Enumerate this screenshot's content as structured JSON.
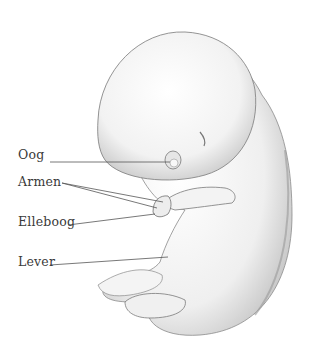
{
  "illustration": {
    "subject": "embryo-anatomy-drawing",
    "labels": [
      {
        "id": "oog",
        "text": "Oog",
        "x": 18,
        "y": 147
      },
      {
        "id": "armen",
        "text": "Armen",
        "x": 18,
        "y": 174
      },
      {
        "id": "elleboog",
        "text": "Elleboog",
        "x": 18,
        "y": 214
      },
      {
        "id": "lever",
        "text": "Lever",
        "x": 18,
        "y": 254
      }
    ],
    "colors": {
      "skin": "#f4f4f4",
      "shade": "#bdbdbd",
      "outline": "#6e6e6e",
      "text": "#3a3a3a",
      "leader": "#555555"
    }
  }
}
